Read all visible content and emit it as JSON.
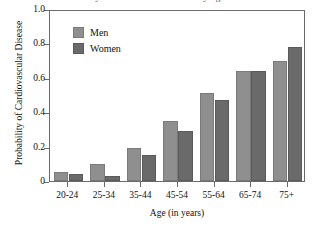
{
  "chart_data": {
    "type": "bar",
    "title": "Probability of Cardiovascular Disease by Age and Sex",
    "xlabel": "Age (in years)",
    "ylabel": "Probability of Cardiovascular Disease",
    "categories": [
      "20-24",
      "25-34",
      "35-44",
      "45-54",
      "55-64",
      "65-74",
      "75+"
    ],
    "series": [
      {
        "name": "Men",
        "color": "#8f8f8f",
        "values": [
          0.05,
          0.1,
          0.19,
          0.35,
          0.51,
          0.64,
          0.7
        ]
      },
      {
        "name": "Women",
        "color": "#6a6a6a",
        "values": [
          0.04,
          0.03,
          0.15,
          0.29,
          0.47,
          0.64,
          0.78
        ]
      }
    ],
    "ylim": [
      0,
      1.0
    ],
    "ytick_values": [
      0,
      0.2,
      0.4,
      0.6,
      0.8,
      1.0
    ],
    "ytick_labels": [
      "0",
      "0.2",
      "0.4",
      "0.6",
      "0.8",
      "1.0"
    ],
    "grid": false,
    "legend_position": "top-left-inside"
  },
  "legend": {
    "entries": [
      {
        "label": "Men"
      },
      {
        "label": "Women"
      }
    ]
  }
}
